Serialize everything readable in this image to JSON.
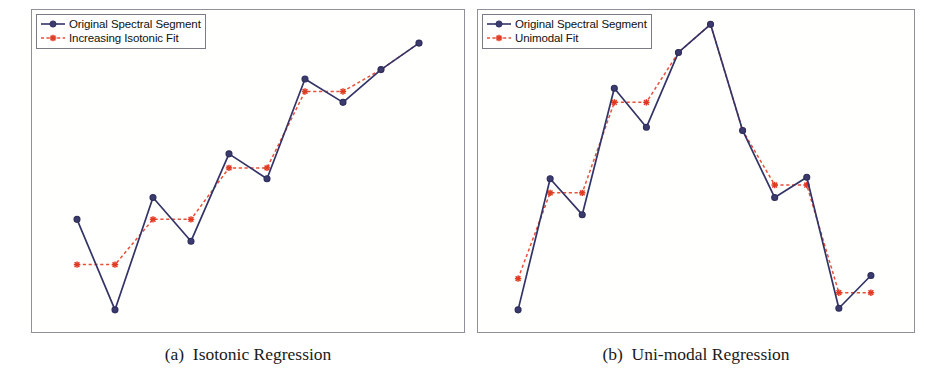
{
  "figure": {
    "width": 933,
    "height": 387,
    "background": "#ffffff",
    "frame_color": "#8f9099"
  },
  "colors": {
    "original_line": "#333366",
    "original_marker_fill": "#3b3b6e",
    "fit_line": "#e8503a",
    "fit_marker": "#e03a22",
    "legend_border": "#7a7b85",
    "caption_text": "#1a1a1a"
  },
  "panels": [
    {
      "id": "a",
      "caption": "(a)  Isotonic Regression",
      "legend": {
        "entries": [
          {
            "label": "Original Spectral Segment",
            "icon": "navy-circle-solid-line-icon",
            "series": "original"
          },
          {
            "label": "Increasing Isotonic Fit",
            "icon": "red-asterisk-dashed-line-icon",
            "series": "fit"
          }
        ]
      }
    },
    {
      "id": "b",
      "caption": "(b)  Uni-modal Regression",
      "legend": {
        "entries": [
          {
            "label": "Original  Spectral Segment",
            "icon": "navy-circle-solid-line-icon",
            "series": "original"
          },
          {
            "label": "Unimodal Fit",
            "icon": "red-asterisk-dashed-line-icon",
            "series": "fit"
          }
        ]
      }
    }
  ],
  "chart_data": [
    {
      "type": "line",
      "panel": "a",
      "title": "(a)  Isotonic Regression",
      "xlabel": "",
      "ylabel": "",
      "grid": false,
      "legend_position": "top-left",
      "axis_ticks": false,
      "xlim": [
        0,
        11
      ],
      "ylim": [
        0,
        10
      ],
      "x": [
        1,
        2,
        3,
        4,
        5,
        6,
        7,
        8,
        9,
        10
      ],
      "series": [
        {
          "name": "Original Spectral Segment",
          "style": "solid",
          "marker": "circle",
          "color": "#333366",
          "values": [
            3.45,
            0.55,
            4.15,
            2.75,
            5.55,
            4.75,
            7.95,
            7.2,
            8.25,
            9.1
          ]
        },
        {
          "name": "Increasing Isotonic Fit",
          "style": "dashed",
          "marker": "asterisk",
          "color": "#e8503a",
          "values": [
            2.0,
            2.0,
            3.45,
            3.45,
            5.1,
            5.1,
            7.55,
            7.55,
            8.25,
            9.1
          ]
        }
      ]
    },
    {
      "type": "line",
      "panel": "b",
      "title": "(b)  Uni-modal Regression",
      "xlabel": "",
      "ylabel": "",
      "grid": false,
      "legend_position": "top-left",
      "axis_ticks": false,
      "xlim": [
        0,
        13
      ],
      "ylim": [
        0,
        10
      ],
      "x": [
        1,
        2,
        3,
        4,
        5,
        6,
        7,
        8,
        9,
        10,
        11,
        12
      ],
      "series": [
        {
          "name": "Original  Spectral Segment",
          "style": "solid",
          "marker": "circle",
          "color": "#333366",
          "values": [
            0.55,
            4.75,
            3.6,
            7.65,
            6.4,
            8.8,
            9.7,
            6.3,
            4.15,
            4.8,
            0.6,
            1.65
          ]
        },
        {
          "name": "Unimodal Fit",
          "style": "dashed",
          "marker": "asterisk",
          "color": "#e8503a",
          "values": [
            1.55,
            4.3,
            4.3,
            7.2,
            7.2,
            8.8,
            9.7,
            6.3,
            4.55,
            4.55,
            1.1,
            1.1
          ]
        }
      ]
    }
  ]
}
